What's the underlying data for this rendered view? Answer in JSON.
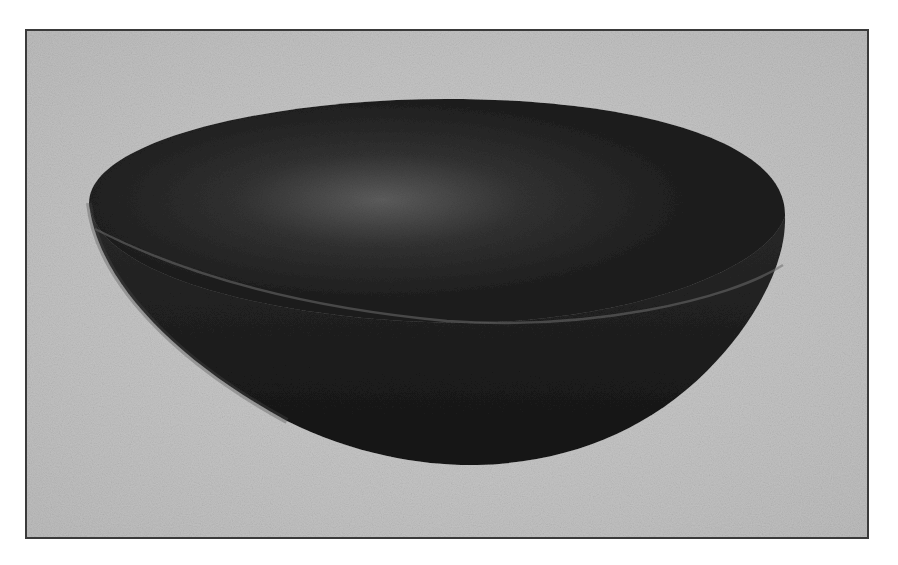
{
  "image": {
    "subject": "bowl",
    "description": "Black-and-white halftone photograph of a dark, shallow hemispherical bowl viewed from slightly above, on a light grey backdrop, framed by a thin dark border.",
    "colors": {
      "page_background": "#ffffff",
      "frame_border": "#3a3a3a",
      "backdrop": "#c9c9c9",
      "bowl_dark": "#1c1c1c",
      "bowl_interior_highlight": "#5a5a5a",
      "rim_highlight": "#6e6e6e"
    }
  }
}
